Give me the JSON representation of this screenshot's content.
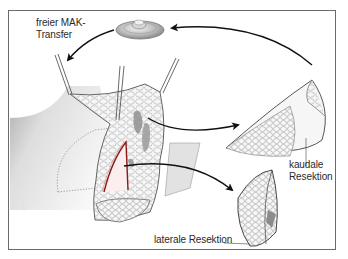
{
  "figure": {
    "labels": {
      "mak_transfer_line1": "freier MAK-",
      "mak_transfer_line2": "Transfer",
      "kaudal_line1": "kaudale",
      "kaudal_line2": "Resektion",
      "lateral": "laterale Resektion"
    },
    "elements": [
      {
        "name": "nipple-areola-complex",
        "description": "free nipple-areola graft disc, top center"
      },
      {
        "name": "breast-tissue-main",
        "description": "central breast tissue with retractor hooks"
      },
      {
        "name": "caudal-resection-specimen",
        "description": "wedge-shaped specimen, right"
      },
      {
        "name": "lateral-resection-specimen",
        "description": "spindle-shaped specimen, bottom right"
      },
      {
        "name": "chest-wall",
        "description": "grey shaded skin flap, left"
      }
    ],
    "colors": {
      "frame": "#6a6a6a",
      "ink": "#1a1a1a",
      "incision": "#8b1a1a",
      "tissue": "#f4f4f4",
      "skin_shade": "#c8c8c8"
    }
  }
}
